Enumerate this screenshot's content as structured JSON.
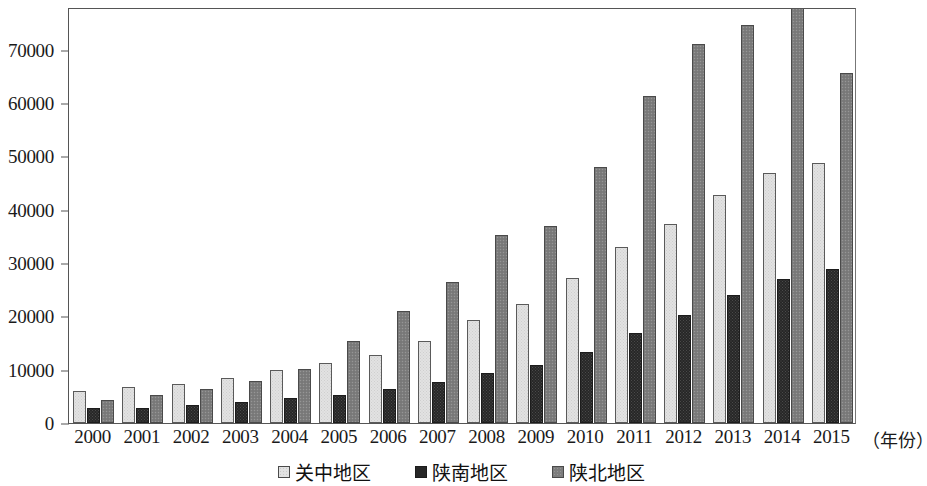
{
  "chart_data": {
    "type": "bar",
    "title": "",
    "xlabel": "（年份）",
    "ylabel": "",
    "categories": [
      "2000",
      "2001",
      "2002",
      "2003",
      "2004",
      "2005",
      "2006",
      "2007",
      "2008",
      "2009",
      "2010",
      "2011",
      "2012",
      "2013",
      "2014",
      "2015"
    ],
    "series": [
      {
        "name": "关中地区",
        "color": "#e2e2e2",
        "values": [
          6000,
          6700,
          7300,
          8400,
          9900,
          11300,
          12700,
          15300,
          19300,
          22300,
          27200,
          33000,
          37400,
          42700,
          46900,
          48800
        ]
      },
      {
        "name": "陕南地区",
        "color": "#272727",
        "values": [
          2800,
          2800,
          3300,
          3900,
          4600,
          5300,
          6400,
          7700,
          9300,
          10900,
          13400,
          16900,
          20200,
          24000,
          27000,
          28900
        ]
      },
      {
        "name": "陕北地区",
        "color": "#7d7d7d",
        "values": [
          4400,
          5200,
          6400,
          7800,
          10100,
          15300,
          21000,
          26400,
          35200,
          36900,
          48000,
          61400,
          71100,
          74600,
          78600,
          65700
        ]
      }
    ],
    "ylim": [
      0,
      78000
    ],
    "y_ticks": [
      0,
      10000,
      20000,
      30000,
      40000,
      50000,
      60000,
      70000
    ],
    "y_tick_labels": [
      "0",
      "10000",
      "20000",
      "30000",
      "40000",
      "50000",
      "60000",
      "70000"
    ],
    "grid": false,
    "legend_position": "bottom",
    "legend": [
      "关中地区",
      "陕南地区",
      "陕北地区"
    ]
  }
}
